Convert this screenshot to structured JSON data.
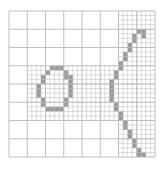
{
  "diagram": {
    "type": "quadtree-decomposition",
    "caption": "Quadtree decomposition of a handwritten glyph",
    "origin": [
      9,
      11
    ],
    "size": 146,
    "top_level_divisions": 8,
    "line_color": "#b8b8b8",
    "fill_color": "#9a9a9a",
    "background": "#ffffff",
    "fine_cell_size": 4.5625,
    "subdivided_regions": [
      {
        "x": 4,
        "y": 3,
        "w": 2,
        "h": 3,
        "levels": 2
      },
      {
        "x": 1,
        "y": 3,
        "w": 1,
        "h": 3,
        "levels": 2
      },
      {
        "x": 2,
        "y": 3,
        "w": 2,
        "h": 3,
        "levels": 2
      },
      {
        "x": 6,
        "y": 0,
        "w": 2,
        "h": 8,
        "levels": 2
      }
    ],
    "strokes": [
      {
        "name": "o-loop",
        "cells": [
          [
            9,
            12
          ],
          [
            10,
            12
          ],
          [
            11,
            12
          ],
          [
            8,
            13
          ],
          [
            12,
            13
          ],
          [
            7,
            14
          ],
          [
            12,
            14
          ],
          [
            13,
            14
          ],
          [
            7,
            15
          ],
          [
            13,
            15
          ],
          [
            6,
            16
          ],
          [
            13,
            16
          ],
          [
            6,
            17
          ],
          [
            13,
            17
          ],
          [
            6,
            18
          ],
          [
            13,
            18
          ],
          [
            7,
            19
          ],
          [
            12,
            19
          ],
          [
            7,
            20
          ],
          [
            12,
            20
          ],
          [
            8,
            21
          ],
          [
            9,
            21
          ],
          [
            10,
            21
          ],
          [
            11,
            21
          ]
        ]
      },
      {
        "name": "paren-curve",
        "cells": [
          [
            28,
            4
          ],
          [
            29,
            4
          ],
          [
            27,
            5
          ],
          [
            29,
            5
          ],
          [
            27,
            6
          ],
          [
            26,
            7
          ],
          [
            26,
            8
          ],
          [
            25,
            9
          ],
          [
            25,
            10
          ],
          [
            24,
            11
          ],
          [
            24,
            12
          ],
          [
            23,
            13
          ],
          [
            23,
            14
          ],
          [
            22,
            15
          ],
          [
            22,
            16
          ],
          [
            22,
            17
          ],
          [
            22,
            18
          ],
          [
            22,
            19
          ],
          [
            23,
            20
          ],
          [
            23,
            21
          ],
          [
            24,
            22
          ],
          [
            24,
            23
          ],
          [
            25,
            24
          ],
          [
            25,
            25
          ],
          [
            26,
            26
          ],
          [
            26,
            27
          ],
          [
            27,
            28
          ],
          [
            27,
            29
          ],
          [
            28,
            30
          ],
          [
            28,
            31
          ],
          [
            29,
            31
          ]
        ]
      }
    ]
  }
}
